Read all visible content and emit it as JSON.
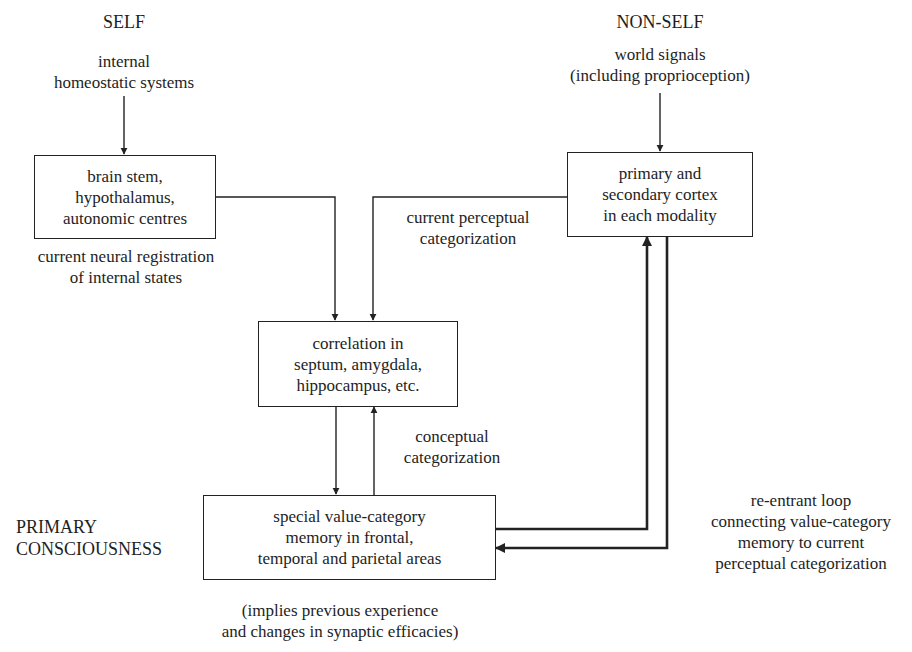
{
  "diagram": {
    "headings": {
      "self": "SELF",
      "non_self": "NON-SELF",
      "primary_consciousness": [
        "PRIMARY",
        "CONSCIOUSNESS"
      ]
    },
    "inputs": {
      "self_input": [
        "internal",
        "homeostatic systems"
      ],
      "non_self_input": [
        "world signals",
        "(including proprioception)"
      ]
    },
    "boxes": {
      "brain_stem": [
        "brain stem,",
        "hypothalamus,",
        "autonomic centres"
      ],
      "cortex": [
        "primary and",
        "secondary cortex",
        "in each modality"
      ],
      "correlation": [
        "correlation in",
        "septum, amygdala,",
        "hippocampus, etc."
      ],
      "memory": [
        "special value-category",
        "memory in frontal,",
        "temporal and parietal areas"
      ]
    },
    "edge_labels": {
      "internal_states": [
        "current neural registration",
        "of internal states"
      ],
      "perceptual": [
        "current perceptual",
        "categorization"
      ],
      "conceptual": [
        "conceptual",
        "categorization"
      ],
      "reentrant": [
        "re-entrant loop",
        "connecting value-category",
        "memory to current",
        "perceptual categorization"
      ],
      "implies": [
        "(implies previous experience",
        "and changes in synaptic efficacies)"
      ]
    },
    "edges": [
      {
        "from": "internal homeostatic systems",
        "to": "brain stem box",
        "style": "thin"
      },
      {
        "from": "world signals",
        "to": "cortex box",
        "style": "thin"
      },
      {
        "from": "brain stem box",
        "to": "correlation box",
        "style": "thin"
      },
      {
        "from": "cortex box",
        "to": "correlation box",
        "style": "thin"
      },
      {
        "from": "correlation box",
        "to": "memory box",
        "style": "thin"
      },
      {
        "from": "memory box",
        "to": "correlation box",
        "style": "thin"
      },
      {
        "from": "memory box",
        "to": "cortex box",
        "style": "thick"
      },
      {
        "from": "cortex box",
        "to": "memory box",
        "style": "thick"
      }
    ]
  }
}
